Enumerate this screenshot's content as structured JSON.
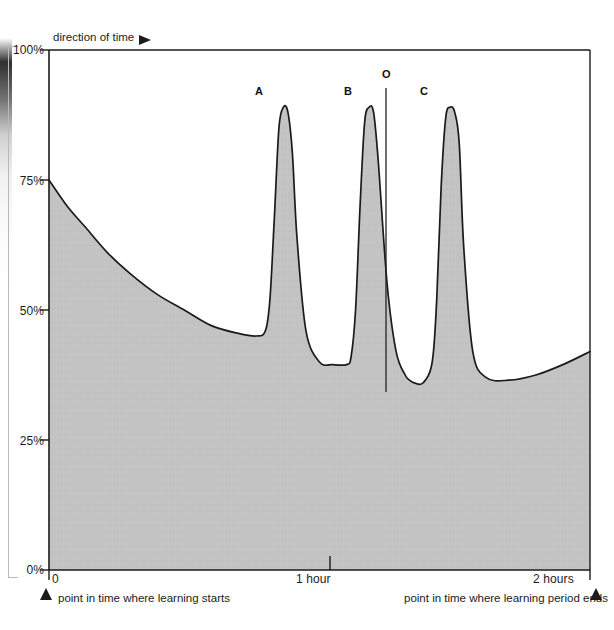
{
  "figure": {
    "direction_note": "direction of time",
    "direction_arrow_icon": "right-triangle-arrow-icon",
    "start_marker_icon": "up-triangle-marker-icon",
    "end_marker_icon": "up-triangle-marker-icon",
    "start_caption": "point in time where learning starts",
    "end_caption": "point in time where learning period ends",
    "colors": {
      "fill": "#c2c2c2",
      "curve": "#1a1a1a",
      "axis": "#1a1a1a",
      "text": "#1b1b1b"
    }
  },
  "chart_data": {
    "type": "area",
    "title": "",
    "subtitle": "",
    "xlabel": "",
    "ylabel": "",
    "xlim": [
      0,
      120
    ],
    "ylim": [
      0,
      100
    ],
    "grid": false,
    "legend_position": "none",
    "x_unit": "minutes",
    "y_unit": "percent retention",
    "xtick_values": [
      0,
      60,
      120
    ],
    "xtick_labels": [
      "0",
      "1 hour",
      "2 hours"
    ],
    "ytick_values": [
      0,
      25,
      50,
      75,
      100
    ],
    "ytick_labels": [
      "0%",
      "25%",
      "50%",
      "75%",
      "100%"
    ],
    "annotations": [
      {
        "label": "A",
        "x": 51,
        "y": 89,
        "note": "first repetition peak"
      },
      {
        "label": "B",
        "x": 70,
        "y": 89,
        "note": "second repetition peak"
      },
      {
        "label": "O",
        "x": 80,
        "y": 96,
        "note": "vertical reference line"
      },
      {
        "label": "C",
        "x": 89,
        "y": 89,
        "note": "third repetition peak"
      }
    ],
    "reference_line": {
      "label": "O",
      "x": 80,
      "y_top": 96,
      "y_bottom": 36
    },
    "series": [
      {
        "name": "retention",
        "x": [
          0,
          4,
          8,
          13,
          18,
          24,
          30,
          36,
          42,
          46,
          48,
          49,
          50,
          51,
          52,
          53,
          54,
          55,
          57,
          60,
          63,
          66,
          67,
          68,
          69,
          70,
          71,
          72,
          73,
          75,
          77,
          79,
          80,
          81,
          83,
          85,
          86,
          87,
          88,
          89,
          90,
          91,
          92,
          94,
          97,
          102,
          108,
          114,
          120
        ],
        "values": [
          75,
          70,
          66,
          61,
          57,
          53,
          50,
          47,
          45.5,
          45,
          46,
          52,
          68,
          85,
          89,
          88,
          80,
          64,
          46,
          40,
          39.5,
          39.5,
          41,
          50,
          70,
          86,
          89,
          88,
          79,
          55,
          42,
          37.5,
          36.5,
          36,
          36,
          40,
          52,
          74,
          87,
          89,
          88,
          82,
          62,
          42,
          37,
          36.5,
          37.5,
          39.5,
          42
        ]
      }
    ]
  }
}
